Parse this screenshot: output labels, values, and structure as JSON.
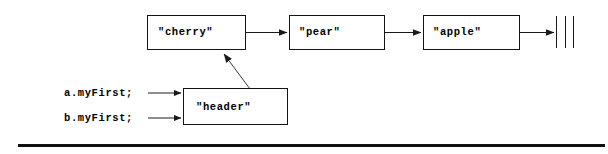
{
  "diagram": {
    "type": "linked-list",
    "nodes": [
      {
        "id": "cherry",
        "label": "\"cherry\"",
        "x": 147,
        "y": 15,
        "w": 99,
        "h": 35
      },
      {
        "id": "pear",
        "label": "\"pear\"",
        "x": 289,
        "y": 15,
        "w": 96,
        "h": 35
      },
      {
        "id": "apple",
        "label": "\"apple\"",
        "x": 423,
        "y": 15,
        "w": 97,
        "h": 35
      },
      {
        "id": "header",
        "label": "\"header\"",
        "x": 183,
        "y": 88,
        "w": 105,
        "h": 37
      }
    ],
    "references": [
      {
        "id": "a-myfirst",
        "label": "a.myFirst;",
        "x": 64,
        "y": 87
      },
      {
        "id": "b-myfirst",
        "label": "b.myFirst;",
        "x": 64,
        "y": 112
      }
    ],
    "terminator": {
      "name": "null-terminator",
      "bars": [
        556,
        565,
        573
      ],
      "top": 16,
      "bottom": 48
    },
    "edges": [
      {
        "from": "cherry",
        "to": "pear",
        "kind": "next-pointer"
      },
      {
        "from": "pear",
        "to": "apple",
        "kind": "next-pointer"
      },
      {
        "from": "apple",
        "to": "terminator",
        "kind": "null-pointer"
      },
      {
        "from": "header",
        "to": "cherry",
        "kind": "first-pointer"
      },
      {
        "from": "a-myfirst",
        "to": "header",
        "kind": "reference"
      },
      {
        "from": "b-myfirst",
        "to": "header",
        "kind": "reference"
      }
    ],
    "colors": {
      "stroke": "#141414",
      "text": "#000000",
      "background": "#ffffff",
      "rule": "#111111"
    },
    "bottom_rule": {
      "x": 18,
      "y": 144,
      "width": 587,
      "height": 3
    }
  }
}
